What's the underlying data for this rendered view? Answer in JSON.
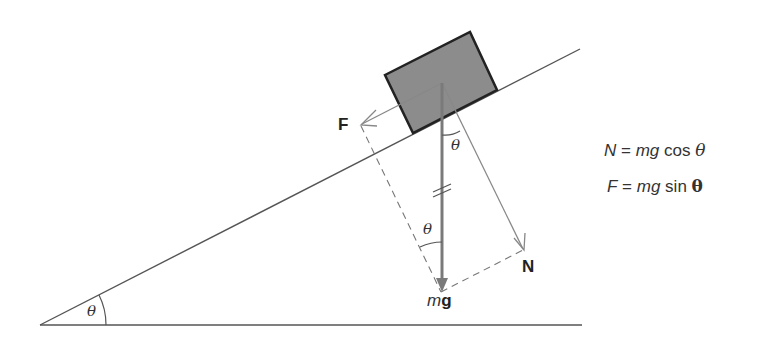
{
  "diagram": {
    "labels": {
      "friction": "F",
      "normal": "N",
      "weight_m": "m",
      "weight_g": "g",
      "angle_incline": "θ",
      "angle_block": "θ",
      "angle_lower": "θ"
    },
    "equations": [
      {
        "lhs": "N",
        "eq": " = ",
        "mid": "mg",
        "fn": " cos ",
        "sym": "θ"
      },
      {
        "lhs": "F",
        "eq": " = ",
        "mid": "mg",
        "fn": " sin ",
        "sym": "θ"
      }
    ],
    "colors": {
      "line": "#555555",
      "block_fill": "#8c8c8c",
      "block_edge": "#222222",
      "weight_arrow": "#7a7a7a",
      "component_arrow": "#888888"
    }
  }
}
